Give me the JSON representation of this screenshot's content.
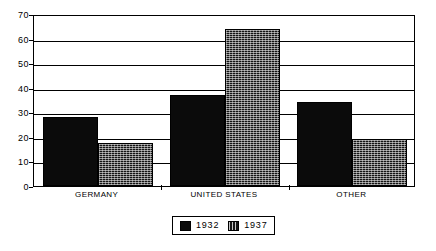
{
  "chart_data": {
    "type": "bar",
    "title": "",
    "subtitle": "",
    "xlabel": "",
    "ylabel": "",
    "categories": [
      "GERMANY",
      "UNITED STATES",
      "OTHER"
    ],
    "series": [
      {
        "name": "1932",
        "values": [
          28,
          37,
          34
        ],
        "fill": "solid-black",
        "color": "#0b0b0b"
      },
      {
        "name": "1937",
        "values": [
          17.5,
          64,
          19
        ],
        "fill": "dark-crosshatch",
        "color": "#141414"
      }
    ],
    "ylim": [
      0,
      70
    ],
    "y_ticks": [
      0,
      10,
      20,
      30,
      40,
      50,
      60,
      70
    ],
    "y_tick_labels": [
      "0",
      "10",
      "20",
      "30",
      "40",
      "50",
      "60",
      "70"
    ],
    "grid": true,
    "grid_axis": "y",
    "legend_position": "bottom-center",
    "legend_entries": [
      "1932",
      "1937"
    ],
    "frame": true,
    "background_color": "#ffffff",
    "axis_color": "#000000"
  }
}
